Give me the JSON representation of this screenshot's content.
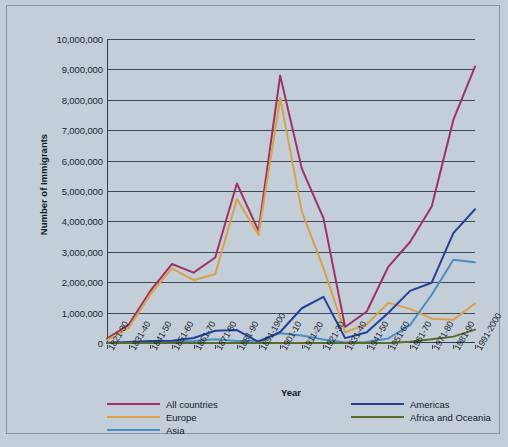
{
  "chart_data": {
    "type": "line",
    "title": "",
    "xlabel": "Year",
    "ylabel": "Number of Immigrants",
    "ylim": [
      0,
      10000000
    ],
    "ytick_step": 1000000,
    "grid": true,
    "legend_position": "bottom",
    "categories": [
      "1821-30",
      "1831-40",
      "1841-50",
      "1851-60",
      "1861-70",
      "1871-80",
      "1881-90",
      "1891-1900",
      "1901-10",
      "1911-20",
      "1921-30",
      "1931-40",
      "1941-50",
      "1951-60",
      "1961-70",
      "1971-80",
      "1981-90",
      "1991-2000"
    ],
    "series": [
      {
        "name": "All countries",
        "color": "#9e3264",
        "values": [
          143000,
          599000,
          1713000,
          2598000,
          2315000,
          2812000,
          5247000,
          3688000,
          8795000,
          5736000,
          4107000,
          528000,
          1035000,
          2515000,
          3322000,
          4493000,
          7338000,
          9095000
        ]
      },
      {
        "name": "Europe",
        "color": "#d9a24a",
        "values": [
          98000,
          496000,
          1597000,
          2453000,
          2065000,
          2272000,
          4735000,
          3555000,
          8056000,
          4322000,
          2463000,
          348000,
          621000,
          1326000,
          1123000,
          800000,
          762000,
          1300000
        ]
      },
      {
        "name": "Asia",
        "color": "#4a8fc4",
        "values": [
          0,
          0,
          0,
          41000,
          64000,
          124000,
          69000,
          74000,
          323000,
          247000,
          112000,
          16000,
          32000,
          150000,
          590000,
          1588000,
          2738000,
          2660000
        ]
      },
      {
        "name": "Americas",
        "color": "#23419a",
        "values": [
          11000,
          33000,
          62000,
          74000,
          166000,
          404000,
          426000,
          38000,
          361000,
          1143000,
          1516000,
          160000,
          355000,
          997000,
          1716000,
          1983000,
          3615000,
          4400000
        ]
      },
      {
        "name": "Africa and Oceania",
        "color": "#5c6b2c",
        "values": [
          0,
          0,
          0,
          0,
          0,
          0,
          0,
          0,
          0,
          0,
          0,
          0,
          0,
          0,
          40000,
          120000,
          210000,
          440000
        ]
      }
    ],
    "ytick_labels": [
      "10,000,000",
      "9,000,000",
      "8,000,000",
      "7,000,000",
      "6,000,000",
      "5,000,000",
      "4,000,000",
      "3,000,000",
      "2,000,000",
      "1,000,000",
      "0"
    ]
  },
  "legend": {
    "left_items": [
      {
        "label": "All countries",
        "color": "#9e3264"
      },
      {
        "label": "Europe",
        "color": "#d9a24a"
      },
      {
        "label": "Asia",
        "color": "#4a8fc4"
      }
    ],
    "right_items": [
      {
        "label": "Americas",
        "color": "#23419a"
      },
      {
        "label": "Africa and Oceania",
        "color": "#5c6b2c"
      }
    ]
  },
  "colors": {
    "background": "#c4ced8",
    "axis": "#2c3e50",
    "grid": "#3a4a5c"
  }
}
